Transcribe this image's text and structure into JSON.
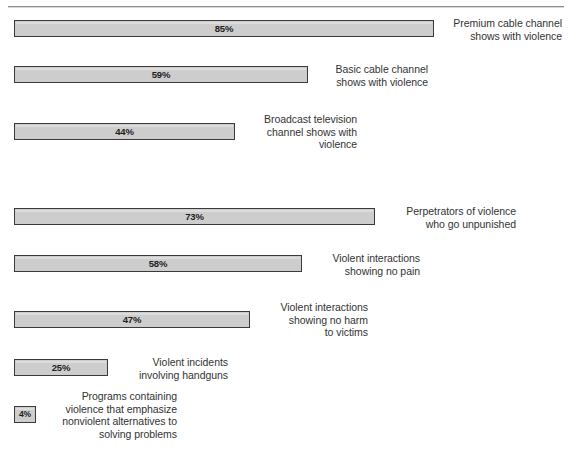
{
  "top_caption": "",
  "chart_data": {
    "type": "bar",
    "orientation": "horizontal",
    "title": "",
    "subtitle": "",
    "xlabel": "",
    "ylabel": "",
    "xlim": [
      0,
      100
    ],
    "grid": false,
    "legend": "none",
    "value_suffix": "%",
    "categories": [
      "Premium cable channel\nshows with violence",
      "Basic cable channel\nshows with violence",
      "Broadcast television\nchannel shows with\nviolence",
      "Perpetrators of violence\nwho go unpunished",
      "Violent interactions\nshowing no pain",
      "Violent interactions\nshowing no harm\nto victims",
      "Violent incidents\ninvolving handguns",
      "Programs containing\nviolence that emphasize\nnonviolent alternatives to\nsolving problems"
    ],
    "values": [
      85,
      59,
      44,
      73,
      58,
      47,
      25,
      4
    ],
    "value_labels": [
      "85%",
      "59%",
      "44%",
      "73%",
      "58%",
      "47%",
      "25%",
      "4%"
    ],
    "colors": {
      "bar_fill": "#cdcdcd",
      "bar_border": "#3a3a3a",
      "text": "#333333",
      "background": "#ffffff"
    }
  },
  "bars": [
    {
      "value_label": "85%",
      "label": "Premium cable channel\nshows with violence",
      "top": 20,
      "width": 420,
      "label_left": 442,
      "label_top": 17,
      "label_width": 120
    },
    {
      "value_label": "59%",
      "label": "Basic cable channel\nshows with violence",
      "top": 66,
      "width": 294,
      "label_left": 316,
      "label_top": 63,
      "label_width": 112
    },
    {
      "value_label": "44%",
      "label": "Broadcast television\nchannel shows with\nviolence",
      "top": 123,
      "width": 221,
      "label_left": 243,
      "label_top": 113,
      "label_width": 114
    },
    {
      "value_label": "73%",
      "label": "Perpetrators of violence\nwho go unpunished",
      "top": 208,
      "width": 361,
      "label_left": 383,
      "label_top": 205,
      "label_width": 133
    },
    {
      "value_label": "58%",
      "label": "Violent interactions\nshowing no pain",
      "top": 255,
      "width": 288,
      "label_left": 310,
      "label_top": 252,
      "label_width": 110
    },
    {
      "value_label": "47%",
      "label": "Violent interactions\nshowing no harm\nto victims",
      "top": 311,
      "width": 236,
      "label_left": 258,
      "label_top": 301,
      "label_width": 110
    },
    {
      "value_label": "25%",
      "label": "Violent incidents\ninvolving handguns",
      "top": 359,
      "width": 94,
      "label_left": 116,
      "label_top": 356,
      "label_width": 112
    },
    {
      "value_label": "4%",
      "label": "Programs containing\nviolence that emphasize\nnonviolent alternatives to\nsolving problems",
      "top": 406,
      "width": 22,
      "label_left": 40,
      "label_top": 390,
      "label_width": 137
    }
  ]
}
